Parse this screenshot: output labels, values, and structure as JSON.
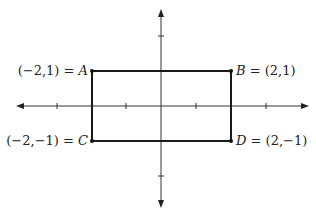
{
  "diagram": {
    "type": "coordinate-plane-rectangle",
    "axes": {
      "x_arrows": true,
      "y_arrows": true,
      "x_ticks": [
        -3,
        -1,
        1,
        3
      ],
      "y_ticks": [
        -2,
        2
      ]
    },
    "points": [
      {
        "name": "A",
        "coords": "(−2,1)",
        "label": "(−2,1) = A",
        "prefix": "(−2,1) = ",
        "letter": "A",
        "x": -2,
        "y": 1
      },
      {
        "name": "B",
        "coords": "(2,1)",
        "label": "B = (2,1)",
        "suffix": " = (2,1)",
        "letter": "B",
        "x": 2,
        "y": 1
      },
      {
        "name": "C",
        "coords": "(−2,−1)",
        "label": "(−2,−1) = C",
        "prefix": "(−2,−1) = ",
        "letter": "C",
        "x": -2,
        "y": -1
      },
      {
        "name": "D",
        "coords": "(2,−1)",
        "label": "D = (2,−1)",
        "suffix": " = (2,−1)",
        "letter": "D",
        "x": 2,
        "y": -1
      }
    ],
    "colors": {
      "line": "#1a1a1a",
      "axis": "#333333",
      "background": "#ffffff"
    }
  }
}
